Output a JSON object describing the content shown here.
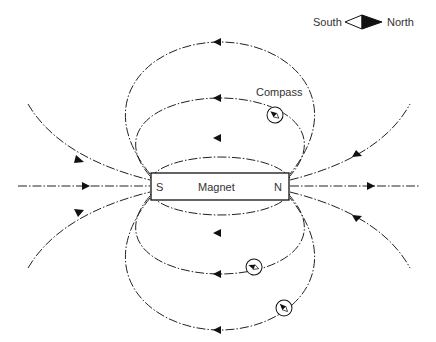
{
  "diagram": {
    "magnet": {
      "label": "Magnet",
      "south_pole": "S",
      "north_pole": "N"
    },
    "legend": {
      "south_label": "South",
      "north_label": "North"
    },
    "compass_label": "Compass",
    "field_direction": "from N pole to S pole outside magnet"
  }
}
